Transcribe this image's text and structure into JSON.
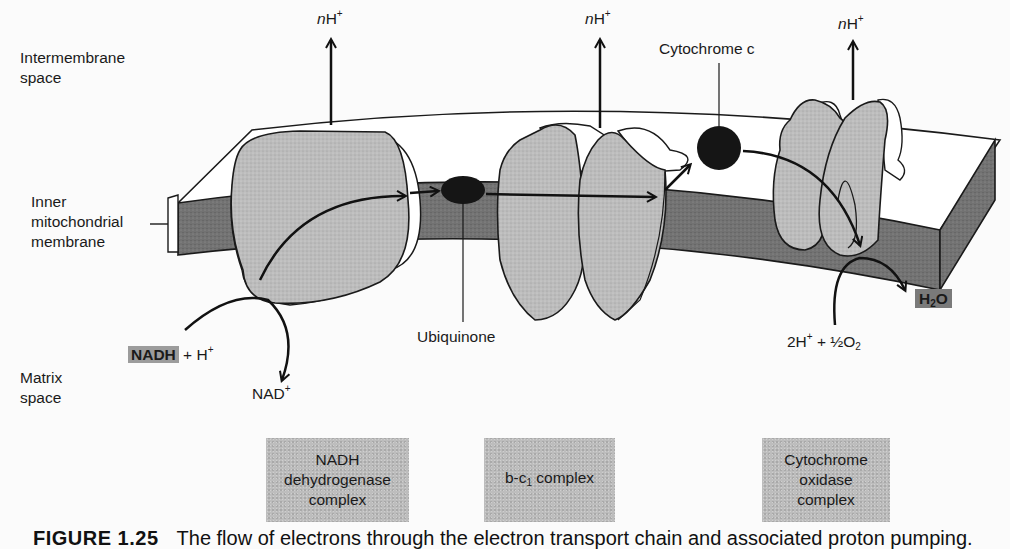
{
  "figure": {
    "caption_label": "FIGURE 1.25",
    "caption_text": "The flow of electrons through the electron transport chain and associated proton pumping."
  },
  "regions": {
    "intermembrane": [
      "Intermembrane",
      "space"
    ],
    "inner_membrane": [
      "Inner",
      "mitochondrial",
      "membrane"
    ],
    "matrix": [
      "Matrix",
      "space"
    ]
  },
  "proton_labels": {
    "prefix": "n",
    "ion": "H",
    "charge": "+",
    "count": 3
  },
  "molecules": {
    "cytochrome_c": "Cytochrome c",
    "ubiquinone": "Ubiquinone",
    "nadh": "NADH",
    "nadh_plus": "+ H",
    "nadh_plus_charge": "+",
    "nad": "NAD",
    "nad_charge": "+",
    "water_h": "H",
    "water_sub": "2",
    "water_o": "O",
    "oxygen_reactants_a": "2H",
    "oxygen_reactants_charge": "+",
    "oxygen_reactants_b": " + ½O",
    "oxygen_reactants_sub": "2"
  },
  "complexes": [
    {
      "lines": [
        "NADH",
        "dehydrogenase",
        "complex"
      ]
    },
    {
      "main": "b-c",
      "sub": "1",
      "rest": " complex"
    },
    {
      "lines": [
        "Cytochrome",
        "oxidase",
        "complex"
      ]
    }
  ],
  "colors": {
    "membrane_band": "#6e6e6e",
    "protein_fill": "#bcbcbc",
    "carrier_fill": "#151515",
    "label_box": "#bdbdbd",
    "highlight": "#9c9c9c",
    "background": "#fbfbfb"
  }
}
